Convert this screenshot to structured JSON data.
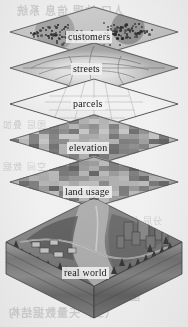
{
  "figure": {
    "kind": "gis-layer-cake-diagram",
    "layer_count": 5
  },
  "layers": [
    {
      "id": "customers",
      "label": "customers",
      "order": 1,
      "style": "point-scatter",
      "fill": "#c9c5bd"
    },
    {
      "id": "streets",
      "label": "streets",
      "order": 2,
      "style": "line-network",
      "fill": "#b5b1a9"
    },
    {
      "id": "parcels",
      "label": "parcels",
      "order": 3,
      "style": "polygon-grid",
      "fill": "#f1eee9"
    },
    {
      "id": "elevation",
      "label": "elevation",
      "order": 4,
      "style": "raster-blocks",
      "fill": "#b0aca4"
    },
    {
      "id": "landusage",
      "label": "land usage",
      "order": 5,
      "style": "raster-blocks",
      "fill": "#a9a59d"
    }
  ],
  "base": {
    "id": "realworld",
    "label": "real world",
    "style": "isometric-terrain-block",
    "features": [
      "trees",
      "houses",
      "roads",
      "river",
      "skyscraper",
      "soil-strata"
    ]
  },
  "watermark": {
    "top": "人口 地理 信息 系统",
    "left_1": "图层 叠加",
    "left_2": "空间 数据",
    "right_1": "分层 模型",
    "bottom_1": "图层模型",
    "bottom_2": "（三）矢量数据结构"
  },
  "colors": {
    "paper": "#f4f2ef",
    "ink": "#1c1a18",
    "layer_light": "#efece6",
    "layer_mid": "#b5b1a9",
    "layer_dark": "#6f6b64",
    "block_top": "#8e8a82",
    "block_side": "#736f68"
  }
}
